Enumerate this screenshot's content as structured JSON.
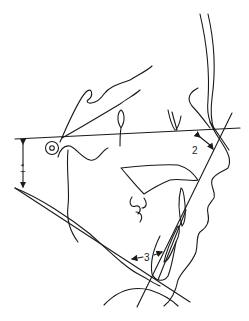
{
  "diagram": {
    "type": "cephalometric tracing (lateral skull profile)",
    "labels": [
      {
        "id": "1",
        "text": "1",
        "meaning": "vertical distance between Frankfort horizontal and mandibular plane"
      },
      {
        "id": "2",
        "text": "2",
        "meaning": "angle between Frankfort horizontal and facial line"
      },
      {
        "id": "3",
        "text": "3",
        "meaning": "angle between mandibular plane and lower incisor axis"
      }
    ],
    "colors": {
      "stroke": "#1a1a1a",
      "background": "#ffffff"
    }
  }
}
